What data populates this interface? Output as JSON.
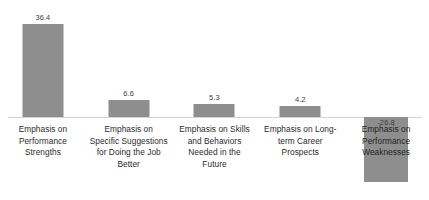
{
  "chart_data": {
    "type": "bar",
    "title": "",
    "subtitle": "",
    "xlabel": "",
    "ylabel": "",
    "grid": false,
    "legend": null,
    "baseline": 0,
    "ylim": [
      -30,
      40
    ],
    "categories": [
      "Emphasis on Performance Strengths",
      "Emphasis on Specific Suggestions for Doing the Job Better",
      "Emphasis on Skills and Behaviors Needed in the Future",
      "Emphasis on Long-term Career Prospects",
      "Emphasis on Performance Weaknesses"
    ],
    "category_lines": [
      [
        "Emphasis on",
        "Performance",
        "Strengths"
      ],
      [
        "Emphasis on",
        "Specific Suggestions",
        "for Doing the Job",
        "Better"
      ],
      [
        "Emphasis on Skills",
        "and Behaviors",
        "Needed in the",
        "Future"
      ],
      [
        "Emphasis on Long-",
        "term Career",
        "Prospects"
      ],
      [
        "Emphasis on",
        "Performance",
        "Weaknesses"
      ]
    ],
    "values": [
      36.4,
      6.6,
      5.3,
      4.2,
      -26.8
    ],
    "value_labels": [
      "36.4",
      "6.6",
      "5.3",
      "4.2",
      "-26.8"
    ],
    "bar_color": "#8e8e8e",
    "axis_color": "#d4d4d4",
    "background": "#ffffff"
  }
}
